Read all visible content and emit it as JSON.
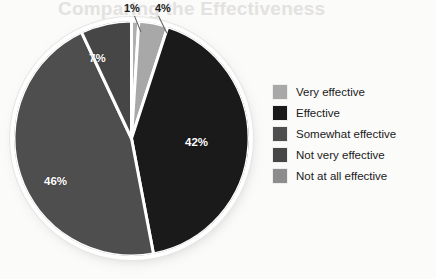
{
  "page": {
    "background_color": "#fbfbfa",
    "watermark_text": "Comparing the Effectiveness"
  },
  "chart_data": {
    "type": "pie",
    "title": "",
    "subtitle": "",
    "xlabel": "",
    "ylabel": "",
    "grid": false,
    "legend_position": "right",
    "start_angle_deg": 0,
    "direction": "clockwise",
    "categories": [
      "Very effective",
      "Effective",
      "Somewhat effective",
      "Not very effective",
      "Not at all effective"
    ],
    "values": [
      4,
      42,
      46,
      7,
      1
    ],
    "value_labels": [
      "4%",
      "42%",
      "46%",
      "7%",
      "1%"
    ],
    "colors": [
      "#a8a8a8",
      "#1a1a1a",
      "#4e4e4e",
      "#464646",
      "#b0b0b0"
    ],
    "slice_gap_color": "#ffffff",
    "slices": [
      {
        "label": "Not at all effective",
        "value": 1,
        "value_label": "1%",
        "color": "#b0b0b0",
        "label_placement": "outside"
      },
      {
        "label": "Very effective",
        "value": 4,
        "value_label": "4%",
        "color": "#a8a8a8",
        "label_placement": "outside"
      },
      {
        "label": "Effective",
        "value": 42,
        "value_label": "42%",
        "color": "#1a1a1a",
        "label_placement": "inside"
      },
      {
        "label": "Somewhat effective",
        "value": 46,
        "value_label": "46%",
        "color": "#4e4e4e",
        "label_placement": "inside"
      },
      {
        "label": "Not very effective",
        "value": 7,
        "value_label": "7%",
        "color": "#464646",
        "label_placement": "inside"
      }
    ]
  },
  "legend": {
    "items": [
      {
        "label": "Very effective",
        "color": "#a8a8a8"
      },
      {
        "label": "Effective",
        "color": "#1a1a1a"
      },
      {
        "label": "Somewhat effective",
        "color": "#4e4e4e"
      },
      {
        "label": "Not very effective",
        "color": "#464646"
      },
      {
        "label": "Not at all effective",
        "color": "#8c8c8c"
      }
    ]
  }
}
